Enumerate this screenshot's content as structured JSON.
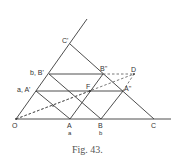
{
  "figure": {
    "caption": "Fig. 43.",
    "points": {
      "O": {
        "label": "O",
        "x": 16,
        "y": 119
      },
      "A": {
        "label": "A",
        "x": 70,
        "y": 119
      },
      "B": {
        "label": "B",
        "x": 101,
        "y": 119
      },
      "C": {
        "label": "C",
        "x": 154,
        "y": 119
      },
      "C_prime": {
        "label": "C'",
        "x": 70,
        "y": 44
      },
      "B_prime": {
        "label": "b, B'",
        "x": 49,
        "y": 74
      },
      "A_prime": {
        "label": "a, A'",
        "x": 36,
        "y": 91
      },
      "B_double_prime": {
        "label": "B''",
        "x": 103,
        "y": 74
      },
      "A_double_prime": {
        "label": "A''",
        "x": 123,
        "y": 91
      },
      "D": {
        "label": "D",
        "x": 134,
        "y": 74
      },
      "F": {
        "label": "F",
        "x": 90,
        "y": 91
      }
    },
    "sublabels": {
      "under_A": "a",
      "under_B": "b"
    },
    "colors": {
      "line": "#3a3a3a",
      "text": "#333333",
      "background": "#ffffff"
    }
  }
}
